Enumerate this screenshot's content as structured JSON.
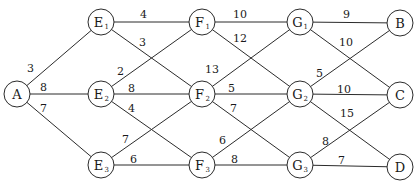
{
  "diagram": {
    "type": "weighted-graph",
    "node_radius": 13,
    "colors": {
      "line": "#2b2b2b",
      "text": "#1a1a1a",
      "background": "#ffffff"
    },
    "nodes": [
      {
        "id": "A",
        "label": "A",
        "sub": "",
        "x": 17,
        "y": 94
      },
      {
        "id": "E1",
        "label": "E",
        "sub": "1",
        "x": 101,
        "y": 22
      },
      {
        "id": "E2",
        "label": "E",
        "sub": "2",
        "x": 101,
        "y": 94
      },
      {
        "id": "E3",
        "label": "E",
        "sub": "3",
        "x": 101,
        "y": 165
      },
      {
        "id": "F1",
        "label": "F",
        "sub": "1",
        "x": 202,
        "y": 22
      },
      {
        "id": "F2",
        "label": "F",
        "sub": "2",
        "x": 202,
        "y": 94
      },
      {
        "id": "F3",
        "label": "F",
        "sub": "3",
        "x": 202,
        "y": 165
      },
      {
        "id": "G1",
        "label": "G",
        "sub": "1",
        "x": 300,
        "y": 22
      },
      {
        "id": "G2",
        "label": "G",
        "sub": "2",
        "x": 300,
        "y": 94
      },
      {
        "id": "G3",
        "label": "G",
        "sub": "3",
        "x": 300,
        "y": 165
      },
      {
        "id": "B",
        "label": "B",
        "sub": "",
        "x": 400,
        "y": 23
      },
      {
        "id": "C",
        "label": "C",
        "sub": "",
        "x": 400,
        "y": 95
      },
      {
        "id": "D",
        "label": "D",
        "sub": "",
        "x": 400,
        "y": 167
      }
    ],
    "edges": [
      {
        "from": "A",
        "to": "E1",
        "weight": "3",
        "lx": 27,
        "ly": 72
      },
      {
        "from": "A",
        "to": "E2",
        "weight": "8",
        "lx": 40,
        "ly": 91
      },
      {
        "from": "A",
        "to": "E3",
        "weight": "7",
        "lx": 40,
        "ly": 112
      },
      {
        "from": "E1",
        "to": "F1",
        "weight": "4",
        "lx": 140,
        "ly": 18
      },
      {
        "from": "E1",
        "to": "F2",
        "weight": "3",
        "lx": 139,
        "ly": 46
      },
      {
        "from": "E2",
        "to": "F1",
        "weight": "2",
        "lx": 117,
        "ly": 75
      },
      {
        "from": "E2",
        "to": "F2",
        "weight": "8",
        "lx": 128,
        "ly": 92
      },
      {
        "from": "E2",
        "to": "F3",
        "weight": "4",
        "lx": 128,
        "ly": 112
      },
      {
        "from": "E3",
        "to": "F2",
        "weight": "7",
        "lx": 122,
        "ly": 143
      },
      {
        "from": "E3",
        "to": "F3",
        "weight": "6",
        "lx": 130,
        "ly": 163
      },
      {
        "from": "F1",
        "to": "G1",
        "weight": "10",
        "lx": 233,
        "ly": 18
      },
      {
        "from": "F1",
        "to": "G2",
        "weight": "12",
        "lx": 233,
        "ly": 42
      },
      {
        "from": "F2",
        "to": "G1",
        "weight": "13",
        "lx": 205,
        "ly": 73
      },
      {
        "from": "F2",
        "to": "G2",
        "weight": "5",
        "lx": 228,
        "ly": 92
      },
      {
        "from": "F2",
        "to": "G3",
        "weight": "7",
        "lx": 230,
        "ly": 112
      },
      {
        "from": "F3",
        "to": "G2",
        "weight": "6",
        "lx": 219,
        "ly": 144
      },
      {
        "from": "F3",
        "to": "G3",
        "weight": "8",
        "lx": 231,
        "ly": 163
      },
      {
        "from": "G1",
        "to": "B",
        "weight": "9",
        "lx": 343,
        "ly": 18
      },
      {
        "from": "G1",
        "to": "C",
        "weight": "10",
        "lx": 339,
        "ly": 46
      },
      {
        "from": "G2",
        "to": "B",
        "weight": "5",
        "lx": 316,
        "ly": 77
      },
      {
        "from": "G2",
        "to": "C",
        "weight": "10",
        "lx": 337,
        "ly": 93
      },
      {
        "from": "G2",
        "to": "D",
        "weight": "15",
        "lx": 340,
        "ly": 117
      },
      {
        "from": "G3",
        "to": "C",
        "weight": "8",
        "lx": 322,
        "ly": 145
      },
      {
        "from": "G3",
        "to": "D",
        "weight": "7",
        "lx": 338,
        "ly": 164
      }
    ]
  }
}
